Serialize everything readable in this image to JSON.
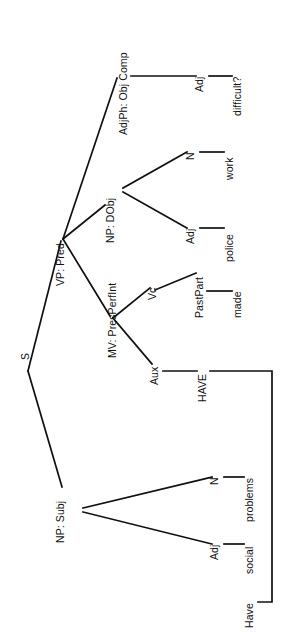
{
  "figure": {
    "kind": "syntax-tree",
    "orientation": "rotated-90-ccw",
    "sentence": "Have social problems made police work difficult?",
    "ink_color": "#101010",
    "background_color": "#ffffff"
  },
  "nodes": {
    "s": "S",
    "np_subj": "NP: Subj",
    "vp_pred": "VP: Pred",
    "mv": "MV: PresPerfInt",
    "np_dobj": "NP: DObj",
    "adjph": "AdjPh: Obj Comp",
    "aux": "Aux",
    "vc": "Vc",
    "subj_adj": "Adj",
    "subj_n": "N",
    "dobj_adj": "Adj",
    "dobj_n": "N",
    "objcomp_adj": "Adj",
    "pastpart": "PastPart"
  },
  "words": {
    "have_moved": "Have",
    "have_base": "HAVE",
    "social": "social",
    "problems": "problems",
    "made": "made",
    "police": "police",
    "work": "work",
    "difficult": "difficult?"
  },
  "edges": [
    {
      "from": "s",
      "to": "np_subj"
    },
    {
      "from": "s",
      "to": "vp_pred"
    },
    {
      "from": "np_subj",
      "to": "subj_adj"
    },
    {
      "from": "np_subj",
      "to": "subj_n"
    },
    {
      "from": "vp_pred",
      "to": "mv"
    },
    {
      "from": "vp_pred",
      "to": "np_dobj"
    },
    {
      "from": "vp_pred",
      "to": "adjph"
    },
    {
      "from": "mv",
      "to": "aux"
    },
    {
      "from": "mv",
      "to": "vc"
    },
    {
      "from": "aux",
      "to": "have_base"
    },
    {
      "from": "vc",
      "to": "pastpart"
    },
    {
      "from": "pastpart",
      "to": "made"
    },
    {
      "from": "np_dobj",
      "to": "dobj_adj"
    },
    {
      "from": "np_dobj",
      "to": "dobj_n"
    },
    {
      "from": "dobj_adj",
      "to": "police"
    },
    {
      "from": "dobj_n",
      "to": "work"
    },
    {
      "from": "adjph",
      "to": "objcomp_adj"
    },
    {
      "from": "objcomp_adj",
      "to": "difficult"
    },
    {
      "from": "subj_adj",
      "to": "social"
    },
    {
      "from": "subj_n",
      "to": "problems"
    },
    {
      "from": "have_base",
      "to": "have_moved",
      "style": "movement-bracket"
    }
  ]
}
